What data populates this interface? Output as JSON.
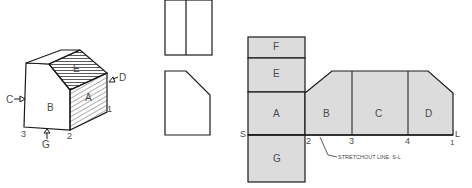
{
  "figure": {
    "pictorial": {
      "faces": {
        "top": "E",
        "front": "B",
        "side": "A",
        "top_small": "F"
      },
      "arrows": {
        "left": "C",
        "right": "D",
        "bottom": "G"
      },
      "corners": [
        "1",
        "2",
        "3"
      ]
    },
    "orthographic": {
      "top_view": "",
      "front_view": ""
    },
    "development": {
      "column_faces": [
        "F",
        "E",
        "A",
        "G"
      ],
      "row_faces": [
        "B",
        "C",
        "D"
      ],
      "stretchout_points": [
        "S",
        "2",
        "3",
        "4",
        "L"
      ],
      "point_one": "1",
      "stretchout_label": "STRETCHOUT  LINE: S-L"
    },
    "colors": {
      "fill": "#dcdcdc",
      "stroke": "#1a1a1a",
      "text": "#4a4a4a"
    }
  }
}
